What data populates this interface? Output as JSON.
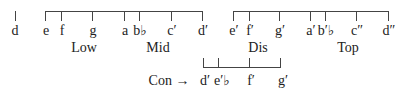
{
  "diagram": {
    "standalone_note": {
      "label": "d"
    },
    "brackets": [
      {
        "name": "low-mid",
        "notes": [
          "e",
          "f",
          "g",
          "a",
          "b♭",
          "c′",
          "d′"
        ],
        "group_labels": [
          "Low",
          "Mid"
        ]
      },
      {
        "name": "dis-top",
        "notes": [
          "e′",
          "f′",
          "g′",
          "a′",
          "b′♭",
          "c″",
          "d″"
        ],
        "group_labels": [
          "Dis",
          "Top"
        ]
      }
    ],
    "con": {
      "label": "Con →",
      "notes": [
        "d′",
        "e′♭",
        "f′",
        "g′"
      ]
    }
  }
}
